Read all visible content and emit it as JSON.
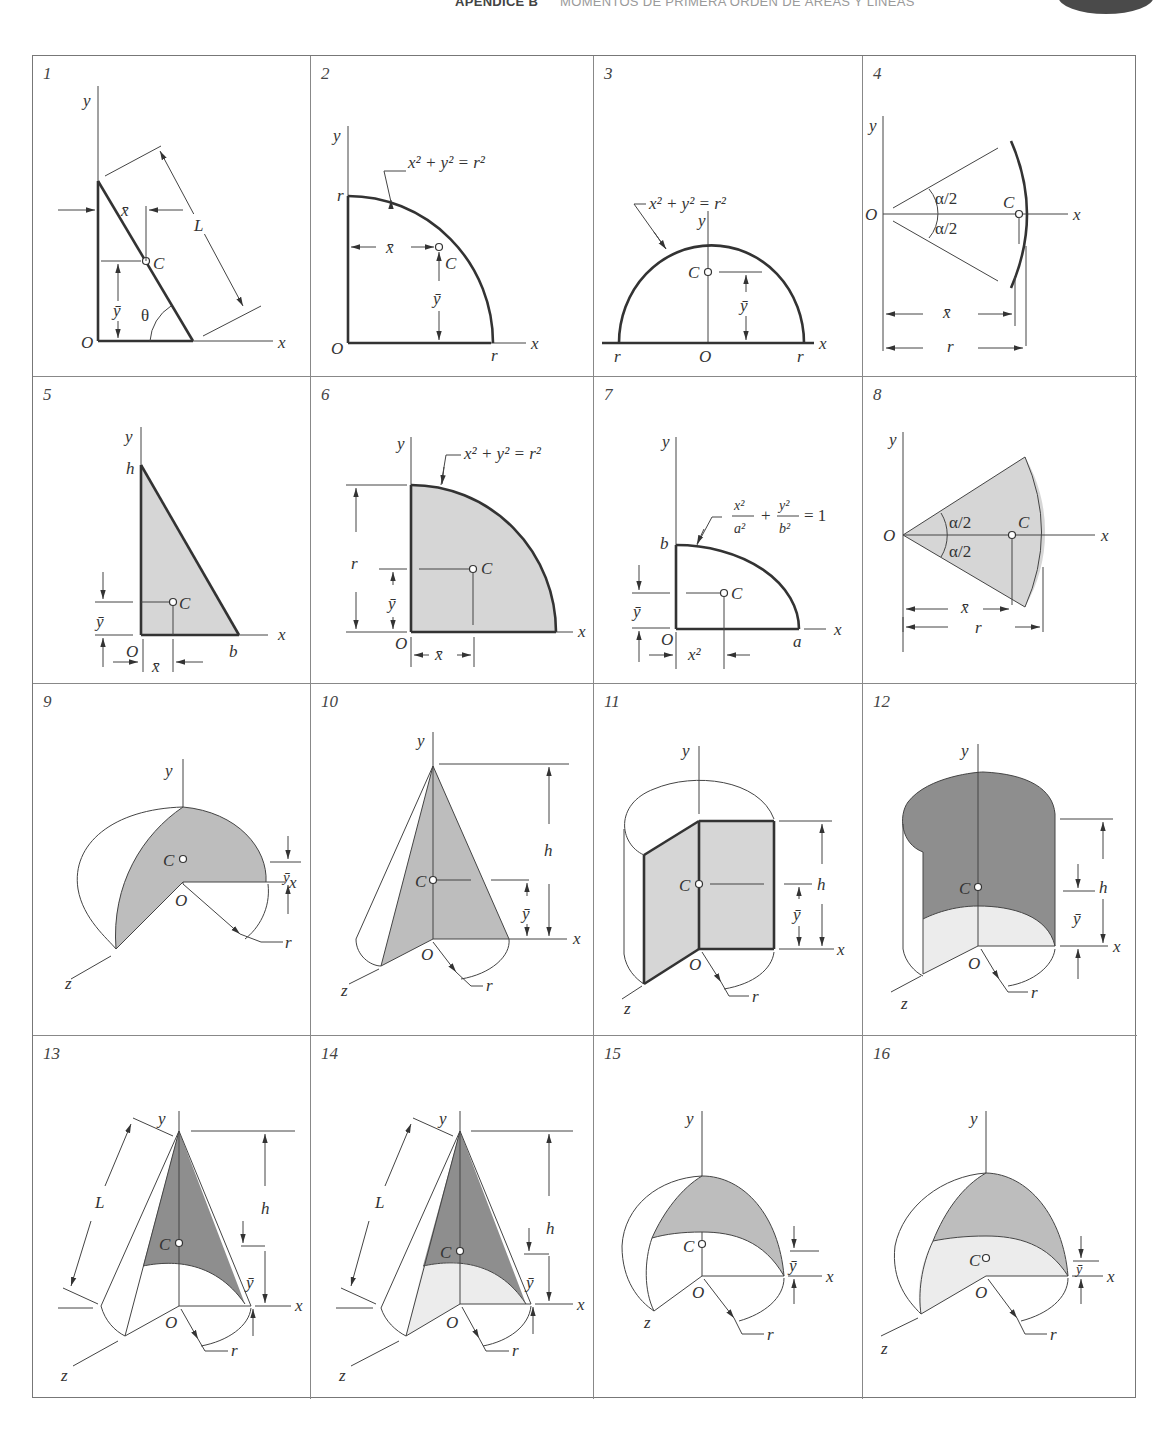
{
  "header": {
    "appendix": "APÉNDICE B",
    "title": "MOMENTOS DE PRIMERA ORDEN DE ÁREAS Y LÍNEAS"
  },
  "labels": {
    "x": "x",
    "y": "y",
    "z": "z",
    "O": "O",
    "C": "C",
    "r": "r",
    "h": "h",
    "b": "b",
    "a": "a",
    "L": "L",
    "theta": "θ",
    "xbar": "x̄",
    "ybar": "ȳ",
    "alpha_half": "α/2",
    "circle_eq": "x² + y² = r²",
    "ellipse_eq_x": "x²",
    "ellipse_eq_a": "a²",
    "ellipse_eq_y": "y²",
    "ellipse_eq_b": "b²",
    "ellipse_eq_plus": "+",
    "ellipse_eq_rhs": "= 1"
  },
  "panels": [
    {
      "number": "1",
      "shape": "straight line segment"
    },
    {
      "number": "2",
      "shape": "quarter-circle arc"
    },
    {
      "number": "3",
      "shape": "semicircular arc"
    },
    {
      "number": "4",
      "shape": "circular arc of angle alpha"
    },
    {
      "number": "5",
      "shape": "triangular area"
    },
    {
      "number": "6",
      "shape": "quarter-circle area"
    },
    {
      "number": "7",
      "shape": "quarter-ellipse area"
    },
    {
      "number": "8",
      "shape": "circular sector area"
    },
    {
      "number": "9",
      "shape": "hemisphere surface quarter"
    },
    {
      "number": "10",
      "shape": "cone section"
    },
    {
      "number": "11",
      "shape": "cylinder section"
    },
    {
      "number": "12",
      "shape": "cylindrical shell"
    },
    {
      "number": "13",
      "shape": "conical shell surface"
    },
    {
      "number": "14",
      "shape": "cone with base"
    },
    {
      "number": "15",
      "shape": "hemispherical shell"
    },
    {
      "number": "16",
      "shape": "hemisphere with base"
    }
  ]
}
